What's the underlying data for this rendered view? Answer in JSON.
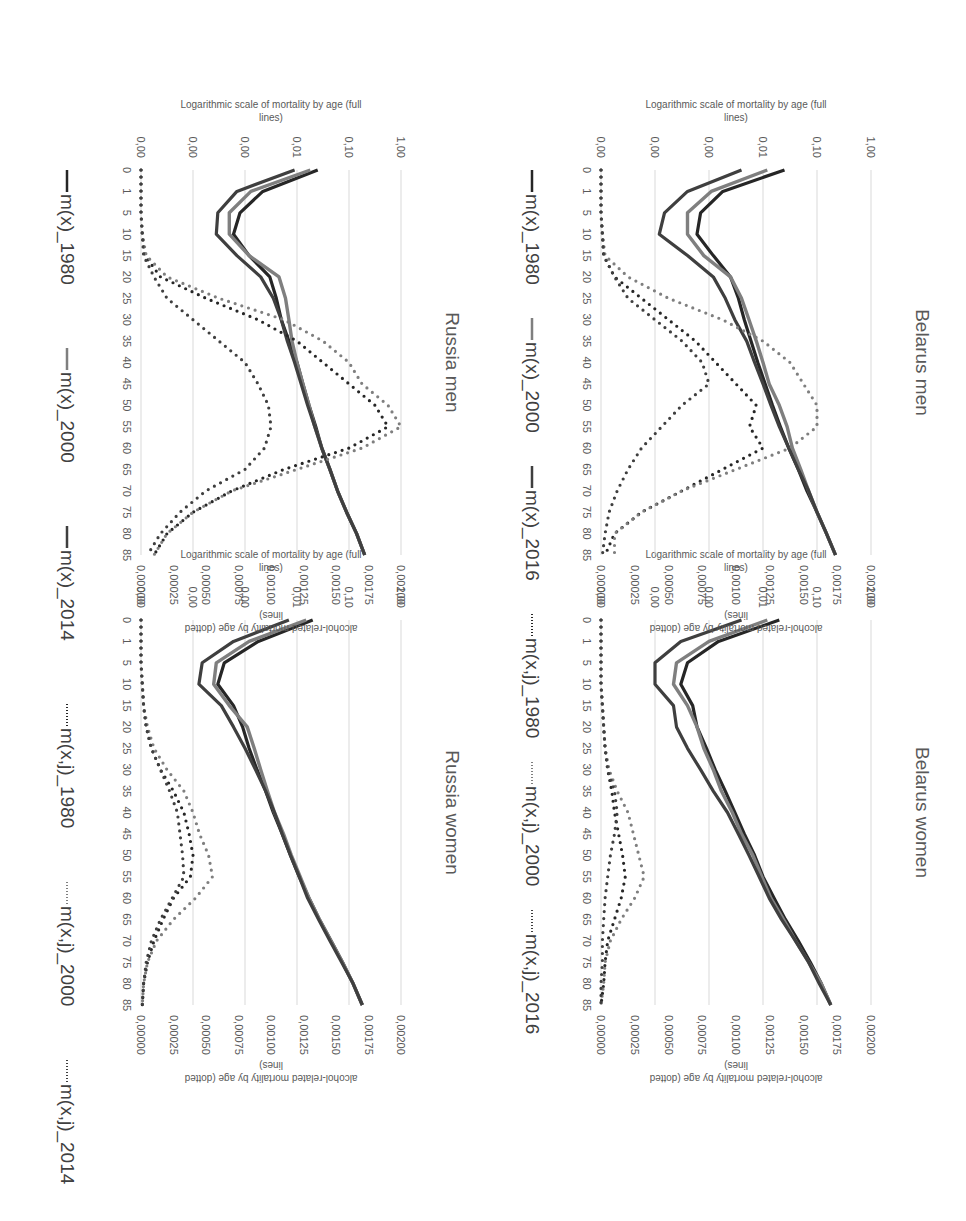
{
  "legend_top": [
    "m(x)_1980",
    "m(x)_2000",
    "m(x)_2016",
    "m(x,j)_1980",
    "m(x,j)_2000",
    "m(x,j)_2016"
  ],
  "legend_bottom": [
    "m(x)_1980",
    "m(x)_2000",
    "m(x)_2014",
    "m(x,j)_1980",
    "m(x,j)_2000",
    "m(x,j)_2014"
  ],
  "colors": {
    "y1980": "#262626",
    "y2000": "#7f7f7f",
    "y2016": "#3f3f3f",
    "grid": "#d9d9d9",
    "text": "#595959"
  },
  "left_axis": {
    "title_line1": "Logarithmic scale of mortality by age (full",
    "title_line2": "lines)",
    "ticks": [
      "1,00",
      "0,10",
      "0,01",
      "0,00",
      "0,00",
      "0,00"
    ]
  },
  "right_axis": {
    "title_line1": "alcohol-related mortality by age (dotted",
    "title_line2": "lines)",
    "ticks": [
      "0,00200",
      "0,00175",
      "0,00150",
      "0,00125",
      "0,00100",
      "0,00075",
      "0,00050",
      "0,00025",
      "0,00000"
    ]
  },
  "x_ticks": [
    "0",
    "1",
    "5",
    "10",
    "15",
    "20",
    "25",
    "30",
    "35",
    "40",
    "45",
    "50",
    "55",
    "60",
    "65",
    "70",
    "75",
    "80",
    "85"
  ],
  "panels": {
    "belarus_men": {
      "title": "Belarus men"
    },
    "belarus_women": {
      "title": "Belarus women"
    },
    "russia_men": {
      "title": "Russia men"
    },
    "russia_women": {
      "title": "Russia women"
    }
  },
  "chart_data": [
    {
      "type": "line",
      "title": "Belarus men",
      "xlabel": "Age",
      "ylabel": "Logarithmic scale of mortality by age (full lines)",
      "ylabel_secondary": "alcohol-related mortality by age (dotted lines)",
      "categories": [
        "0",
        "1",
        "5",
        "10",
        "15",
        "20",
        "25",
        "30",
        "35",
        "40",
        "45",
        "50",
        "55",
        "60",
        "65",
        "70",
        "75",
        "80",
        "85"
      ],
      "y_scale": "log",
      "ylim": [
        1e-05,
        1.0
      ],
      "y2lim": [
        0,
        0.002
      ],
      "series": [
        {
          "name": "m(x)_1980",
          "axis": "log",
          "values": [
            0.025,
            0.0018,
            0.0007,
            0.0006,
            0.0012,
            0.0025,
            0.0035,
            0.0045,
            0.006,
            0.008,
            0.011,
            0.015,
            0.021,
            0.03,
            0.045,
            0.065,
            0.1,
            0.15,
            0.22
          ]
        },
        {
          "name": "m(x)_2000",
          "axis": "log",
          "values": [
            0.012,
            0.0011,
            0.0004,
            0.0004,
            0.0008,
            0.0025,
            0.004,
            0.0055,
            0.0075,
            0.01,
            0.013,
            0.02,
            0.028,
            0.035,
            0.05,
            0.07,
            0.1,
            0.15,
            0.22
          ]
        },
        {
          "name": "m(x)_2016",
          "axis": "log",
          "values": [
            0.004,
            0.0004,
            0.00015,
            0.00012,
            0.0004,
            0.0012,
            0.002,
            0.003,
            0.005,
            0.007,
            0.01,
            0.014,
            0.02,
            0.03,
            0.045,
            0.07,
            0.1,
            0.15,
            0.22
          ]
        },
        {
          "name": "m(x,j)_1980",
          "axis": "linear",
          "values": [
            0.0,
            0.0,
            0.0,
            1e-05,
            2e-05,
            0.0001,
            0.0003,
            0.0005,
            0.0007,
            0.00085,
            0.001,
            0.00115,
            0.0011,
            0.0012,
            0.0009,
            0.0006,
            0.0003,
            0.0001,
            3e-05
          ]
        },
        {
          "name": "m(x,j)_2000",
          "axis": "linear",
          "values": [
            0.0,
            0.0,
            0.0,
            1e-05,
            3e-05,
            0.0002,
            0.0005,
            0.0009,
            0.0012,
            0.0014,
            0.0015,
            0.0016,
            0.0016,
            0.0014,
            0.001,
            0.0006,
            0.0003,
            0.0001,
            0.0001
          ]
        },
        {
          "name": "m(x,j)_2016",
          "axis": "linear",
          "values": [
            0.0,
            0.0,
            0.0,
            1e-05,
            2e-05,
            0.0001,
            0.0002,
            0.0004,
            0.0006,
            0.00075,
            0.0008,
            0.0006,
            0.00045,
            0.0003,
            0.0002,
            0.00012,
            6e-05,
            3e-05,
            1e-05
          ]
        }
      ]
    },
    {
      "type": "line",
      "title": "Belarus women",
      "xlabel": "Age",
      "categories": [
        "0",
        "1",
        "5",
        "10",
        "15",
        "20",
        "25",
        "30",
        "35",
        "40",
        "45",
        "50",
        "55",
        "60",
        "65",
        "70",
        "75",
        "80",
        "85"
      ],
      "y_scale": "log",
      "ylim": [
        1e-05,
        1.0
      ],
      "y2lim": [
        0,
        0.002
      ],
      "series": [
        {
          "name": "m(x)_1980",
          "axis": "log",
          "values": [
            0.02,
            0.0015,
            0.0004,
            0.0003,
            0.0005,
            0.0006,
            0.0009,
            0.0013,
            0.002,
            0.003,
            0.0045,
            0.007,
            0.01,
            0.016,
            0.026,
            0.045,
            0.075,
            0.12,
            0.18
          ]
        },
        {
          "name": "m(x)_2000",
          "axis": "log",
          "values": [
            0.012,
            0.001,
            0.00025,
            0.00022,
            0.0004,
            0.0006,
            0.0008,
            0.0012,
            0.0017,
            0.0027,
            0.004,
            0.0065,
            0.0095,
            0.014,
            0.024,
            0.04,
            0.07,
            0.12,
            0.18
          ]
        },
        {
          "name": "m(x)_2016",
          "axis": "log",
          "values": [
            0.004,
            0.0003,
            0.0001,
            0.0001,
            0.00022,
            0.00025,
            0.0004,
            0.0007,
            0.0012,
            0.0022,
            0.0035,
            0.0055,
            0.0085,
            0.013,
            0.022,
            0.04,
            0.07,
            0.11,
            0.18
          ]
        },
        {
          "name": "m(x,j)_1980",
          "axis": "linear",
          "values": [
            0.0,
            0.0,
            0.0,
            0.0,
            1e-05,
            2e-05,
            3e-05,
            5e-05,
            8e-05,
            0.0001,
            0.00013,
            0.00016,
            0.00018,
            0.00015,
            0.0001,
            5e-05,
            3e-05,
            2e-05,
            0.0
          ]
        },
        {
          "name": "m(x,j)_2000",
          "axis": "linear",
          "values": [
            0.0,
            0.0,
            0.0,
            0.0,
            1e-05,
            2e-05,
            3e-05,
            6e-05,
            0.00012,
            0.0002,
            0.00024,
            0.00028,
            0.00032,
            0.00025,
            0.00015,
            7e-05,
            3e-05,
            2e-05,
            0.0
          ]
        },
        {
          "name": "m(x,j)_2016",
          "axis": "linear",
          "values": [
            0.0,
            0.0,
            0.0,
            0.0,
            1e-05,
            2e-05,
            3e-05,
            5e-05,
            0.0001,
            0.00012,
            0.0001,
            7e-05,
            5e-05,
            3e-05,
            2e-05,
            1e-05,
            1e-05,
            0.0,
            0.0
          ]
        }
      ]
    },
    {
      "type": "line",
      "title": "Russia men",
      "xlabel": "Age",
      "categories": [
        "0",
        "1",
        "5",
        "10",
        "15",
        "20",
        "25",
        "30",
        "35",
        "40",
        "45",
        "50",
        "55",
        "60",
        "65",
        "70",
        "75",
        "80",
        "85"
      ],
      "y_scale": "log",
      "ylim": [
        1e-05,
        1.0
      ],
      "y2lim": [
        0,
        0.002
      ],
      "series": [
        {
          "name": "m(x)_1980",
          "axis": "log",
          "values": [
            0.025,
            0.0022,
            0.0008,
            0.0006,
            0.0012,
            0.003,
            0.004,
            0.005,
            0.007,
            0.01,
            0.013,
            0.017,
            0.023,
            0.03,
            0.043,
            0.06,
            0.09,
            0.14,
            0.2
          ]
        },
        {
          "name": "m(x)_2000",
          "axis": "log",
          "values": [
            0.018,
            0.0013,
            0.0005,
            0.0005,
            0.0012,
            0.0045,
            0.006,
            0.007,
            0.008,
            0.01,
            0.013,
            0.017,
            0.022,
            0.03,
            0.043,
            0.06,
            0.09,
            0.14,
            0.2
          ]
        },
        {
          "name": "m(x)_2014",
          "axis": "log",
          "values": [
            0.009,
            0.0007,
            0.0003,
            0.00028,
            0.0007,
            0.002,
            0.0035,
            0.005,
            0.0065,
            0.009,
            0.012,
            0.016,
            0.022,
            0.03,
            0.043,
            0.06,
            0.09,
            0.14,
            0.2
          ]
        },
        {
          "name": "m(x,j)_1980",
          "axis": "linear",
          "values": [
            0.0,
            0.0,
            0.0,
            1e-05,
            3e-05,
            0.00015,
            0.0005,
            0.0009,
            0.0012,
            0.0014,
            0.0016,
            0.0018,
            0.0019,
            0.0016,
            0.0011,
            0.0007,
            0.0004,
            0.0002,
            0.0001
          ]
        },
        {
          "name": "m(x,j)_2000",
          "axis": "linear",
          "values": [
            0.0,
            0.0,
            0.0,
            1e-05,
            4e-05,
            0.0002,
            0.0006,
            0.0011,
            0.0014,
            0.0016,
            0.0017,
            0.0019,
            0.002,
            0.0017,
            0.0012,
            0.0007,
            0.0004,
            0.0002,
            0.0001
          ]
        },
        {
          "name": "m(x,j)_2014",
          "axis": "linear",
          "values": [
            0.0,
            0.0,
            0.0,
            1e-05,
            2e-05,
            0.0001,
            0.0002,
            0.0004,
            0.0006,
            0.0008,
            0.0009,
            0.00098,
            0.001,
            0.00095,
            0.0008,
            0.0005,
            0.0003,
            0.00015,
            5e-05
          ]
        }
      ]
    },
    {
      "type": "line",
      "title": "Russia women",
      "xlabel": "Age",
      "categories": [
        "0",
        "1",
        "5",
        "10",
        "15",
        "20",
        "25",
        "30",
        "35",
        "40",
        "45",
        "50",
        "55",
        "60",
        "65",
        "70",
        "75",
        "80",
        "85"
      ],
      "y_scale": "log",
      "ylim": [
        1e-05,
        1.0
      ],
      "y2lim": [
        0,
        0.002
      ],
      "series": [
        {
          "name": "m(x)_1980",
          "axis": "log",
          "values": [
            0.02,
            0.0018,
            0.0004,
            0.0003,
            0.0006,
            0.0009,
            0.0012,
            0.0017,
            0.0025,
            0.0035,
            0.0052,
            0.0075,
            0.011,
            0.017,
            0.027,
            0.045,
            0.075,
            0.12,
            0.18
          ]
        },
        {
          "name": "m(x)_2000",
          "axis": "log",
          "values": [
            0.015,
            0.0012,
            0.00028,
            0.00025,
            0.0005,
            0.0011,
            0.0015,
            0.002,
            0.0027,
            0.0037,
            0.0055,
            0.0078,
            0.0115,
            0.017,
            0.027,
            0.045,
            0.075,
            0.12,
            0.18
          ]
        },
        {
          "name": "m(x)_2014",
          "axis": "log",
          "values": [
            0.007,
            0.0006,
            0.00015,
            0.00013,
            0.00035,
            0.0006,
            0.001,
            0.0016,
            0.0025,
            0.0037,
            0.0052,
            0.0075,
            0.011,
            0.016,
            0.026,
            0.043,
            0.072,
            0.12,
            0.18
          ]
        },
        {
          "name": "m(x,j)_1980",
          "axis": "linear",
          "values": [
            0.0,
            0.0,
            0.0,
            1e-05,
            2e-05,
            4e-05,
            8e-05,
            0.00015,
            0.00025,
            0.00033,
            0.00037,
            0.0004,
            0.00038,
            0.00025,
            0.00017,
            0.0001,
            5e-05,
            2e-05,
            1e-05
          ]
        },
        {
          "name": "m(x,j)_2000",
          "axis": "linear",
          "values": [
            0.0,
            0.0,
            0.0,
            1e-05,
            2e-05,
            5e-05,
            0.0001,
            0.0002,
            0.00033,
            0.0004,
            0.00045,
            0.00052,
            0.00055,
            0.00042,
            0.00025,
            0.00012,
            5e-05,
            2e-05,
            1e-05
          ]
        },
        {
          "name": "m(x,j)_2014",
          "axis": "linear",
          "values": [
            0.0,
            0.0,
            0.0,
            1e-05,
            2e-05,
            4e-05,
            8e-05,
            0.00015,
            0.00022,
            0.00028,
            0.0003,
            0.00032,
            0.00033,
            0.00024,
            0.00015,
            8e-05,
            4e-05,
            2e-05,
            1e-05
          ]
        }
      ]
    }
  ]
}
